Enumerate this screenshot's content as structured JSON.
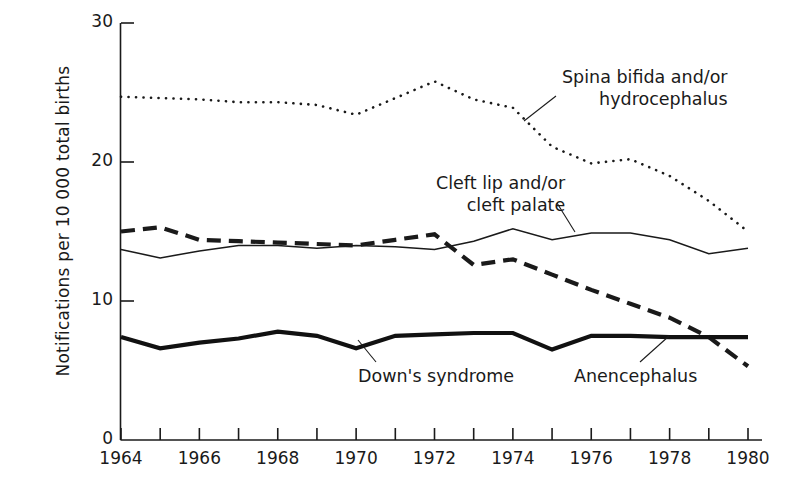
{
  "chart_data": {
    "type": "line",
    "title": "",
    "xlabel": "",
    "ylabel": "Notifications per 10 000 total births",
    "xlim": [
      1963.5,
      1980.5
    ],
    "ylim": [
      0,
      30
    ],
    "grid": false,
    "legend_position": "inline-annotations",
    "x": [
      1964,
      1965,
      1966,
      1967,
      1968,
      1969,
      1970,
      1971,
      1972,
      1973,
      1974,
      1975,
      1976,
      1977,
      1978,
      1979,
      1980
    ],
    "xticks": [
      1964,
      1965,
      1966,
      1967,
      1968,
      1969,
      1970,
      1971,
      1972,
      1973,
      1974,
      1975,
      1976,
      1977,
      1978,
      1979,
      1980
    ],
    "xtick_labels_shown": [
      "1964",
      "1966",
      "1968",
      "1970",
      "1972",
      "1974",
      "1976",
      "1978",
      "1980"
    ],
    "yticks": [
      0,
      10,
      20,
      30
    ],
    "ytick_labels": [
      "0",
      "10",
      "20",
      "30"
    ],
    "series": [
      {
        "name": "Spina bifida and/or hydrocephalus",
        "style": "dotted",
        "color": "#1a1a1a",
        "values": [
          24.7,
          24.6,
          24.5,
          24.3,
          24.3,
          24.1,
          23.4,
          24.6,
          25.8,
          24.5,
          23.9,
          21.1,
          19.9,
          20.2,
          19.0,
          17.2,
          15.0
        ]
      },
      {
        "name": "Cleft lip and/or cleft palate",
        "style": "thin-solid",
        "color": "#1a1a1a",
        "values": [
          13.7,
          13.1,
          13.6,
          14.0,
          14.0,
          13.8,
          14.0,
          13.9,
          13.7,
          14.3,
          15.2,
          14.4,
          14.9,
          14.9,
          14.4,
          13.4,
          13.8
        ]
      },
      {
        "name": "Anencephalus",
        "style": "dashed",
        "color": "#1a1a1a",
        "values": [
          15.0,
          15.3,
          14.4,
          14.3,
          14.2,
          14.1,
          14.0,
          14.4,
          14.8,
          12.6,
          13.0,
          11.9,
          10.8,
          9.8,
          8.8,
          7.4,
          5.3
        ]
      },
      {
        "name": "Down's syndrome",
        "style": "thick-solid",
        "color": "#111111",
        "values": [
          7.4,
          6.6,
          7.0,
          7.3,
          7.8,
          7.5,
          6.6,
          7.5,
          7.6,
          7.7,
          7.7,
          6.5,
          7.5,
          7.5,
          7.4,
          7.4,
          7.4
        ]
      }
    ],
    "annotations": [
      {
        "id": "spina-bifida",
        "text_line1": "Spina bifida and/or",
        "text_line2": "hydrocephalus",
        "target_x": 1976.0,
        "target_y": 21.1
      },
      {
        "id": "cleft-lip",
        "text_line1": "Cleft lip and/or",
        "text_line2": "cleft palate",
        "target_x": 1975.4,
        "target_y": 14.6
      },
      {
        "id": "downs-syndrome",
        "text_line1": "Down's syndrome",
        "text_line2": "",
        "target_x": 1970.2,
        "target_y": 6.7
      },
      {
        "id": "anencephalus",
        "text_line1": "Anencephalus",
        "text_line2": "",
        "target_x": 1979.5,
        "target_y": 6.6
      }
    ]
  }
}
